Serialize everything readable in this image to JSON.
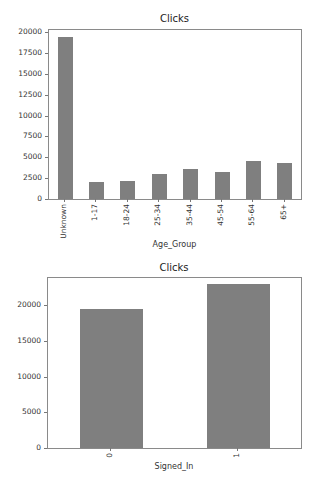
{
  "chart_data": [
    {
      "type": "bar",
      "title": "Clicks",
      "xlabel": "Age_Group",
      "ylabel": "",
      "categories": [
        "Unknown",
        "1-17",
        "18-24",
        "25-34",
        "35-44",
        "45-54",
        "55-64",
        "65+"
      ],
      "values": [
        19450,
        2050,
        2200,
        2950,
        3600,
        3200,
        4500,
        4300
      ],
      "yticks": [
        "0",
        "2500",
        "5000",
        "7500",
        "10000",
        "12500",
        "15000",
        "17500",
        "20000"
      ],
      "ylim": [
        0,
        20400
      ],
      "grid": false,
      "legend": null,
      "bar_color": "#7f7f7f"
    },
    {
      "type": "bar",
      "title": "Clicks",
      "xlabel": "Signed_In",
      "ylabel": "",
      "categories": [
        "0",
        "1"
      ],
      "values": [
        19400,
        22900
      ],
      "yticks": [
        "0",
        "5000",
        "10000",
        "15000",
        "20000"
      ],
      "ylim": [
        0,
        24000
      ],
      "grid": false,
      "legend": null,
      "bar_color": "#7f7f7f"
    }
  ]
}
